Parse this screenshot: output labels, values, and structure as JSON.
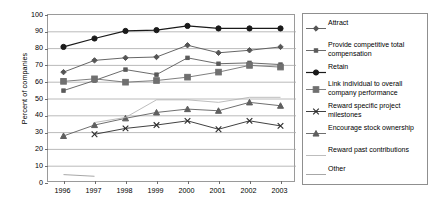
{
  "chart_data": {
    "type": "line",
    "title": "",
    "xlabel": "",
    "ylabel": "Percent of companies",
    "categories": [
      "1996",
      "1997",
      "1998",
      "1999",
      "2000",
      "2001",
      "2002",
      "2003"
    ],
    "ylim": [
      0,
      100
    ],
    "yticks": [
      0,
      10,
      20,
      30,
      40,
      50,
      60,
      70,
      80,
      90,
      100
    ],
    "grid": true,
    "legend_position": "right",
    "series": [
      {
        "name": "Attract",
        "marker": "diamond",
        "color": "#555555",
        "values": [
          66,
          73,
          74.5,
          75,
          82,
          77.5,
          79,
          81
        ]
      },
      {
        "name": "Provide competitive total compensation",
        "marker": "square-small",
        "color": "#5a5a5a",
        "values": [
          55,
          61,
          67.5,
          64.5,
          74.5,
          71,
          71.5,
          70.5
        ]
      },
      {
        "name": "Retain",
        "marker": "circle",
        "color": "#1a1a1a",
        "values": [
          81,
          86,
          90.5,
          91,
          93.5,
          92,
          92,
          92
        ]
      },
      {
        "name": "Link individual to overall company performance",
        "marker": "square",
        "color": "#707070",
        "values": [
          60.5,
          62,
          60,
          61,
          63,
          66,
          70,
          69
        ]
      },
      {
        "name": "Reward specific project milestones",
        "marker": "x",
        "color": "#2b2b2b",
        "values": [
          null,
          29,
          32.5,
          34.5,
          37,
          32,
          37,
          34
        ]
      },
      {
        "name": "Encourage stock ownership",
        "marker": "triangle",
        "color": "#5f5f5f",
        "values": [
          28,
          34.5,
          38.5,
          42,
          44,
          43,
          48,
          46
        ]
      },
      {
        "name": "Reward past contributions",
        "marker": "none",
        "color": "#b5b5b5",
        "values": [
          null,
          36,
          39,
          49.5,
          49.5,
          48,
          51,
          51
        ]
      },
      {
        "name": "Other",
        "marker": "none",
        "color": "#9d9d9d",
        "values": [
          5,
          4,
          null,
          null,
          null,
          null,
          null,
          null
        ]
      }
    ]
  },
  "legend": {
    "items": [
      {
        "label": "Attract",
        "key": "diamond-marker-icon"
      },
      {
        "label": "Provide competitive total compensation",
        "key": "square-small-marker-icon"
      },
      {
        "label": "Retain",
        "key": "circle-marker-icon"
      },
      {
        "label": "Link individual to overall company performance",
        "key": "square-marker-icon"
      },
      {
        "label": "Reward specific project milestones",
        "key": "x-marker-icon"
      },
      {
        "label": "Encourage stock ownership",
        "key": "triangle-marker-icon"
      },
      {
        "label": "Reward past contributions",
        "key": "line-marker-icon"
      },
      {
        "label": "Other",
        "key": "line-marker-icon"
      }
    ]
  }
}
